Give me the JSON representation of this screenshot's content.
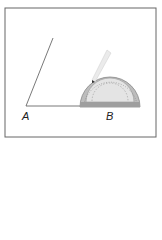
{
  "diagram": {
    "labels": {
      "a": "A",
      "b": "B"
    },
    "colors": {
      "frame": "#555555",
      "line": "#444444",
      "protractor": "#9a9a9a",
      "pencil": "#e6e6e6"
    }
  }
}
